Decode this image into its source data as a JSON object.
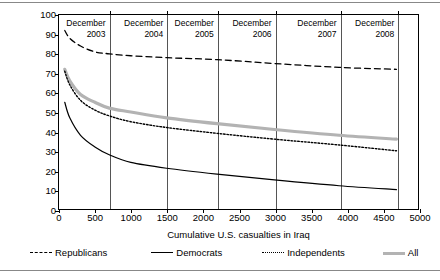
{
  "chart_data": {
    "type": "line",
    "title": "",
    "xlabel": "Cumulative U.S. casualties in Iraq",
    "ylabel": "Percentage supporting the war",
    "xlim": [
      0,
      5000
    ],
    "ylim": [
      0,
      100
    ],
    "xticks": [
      0,
      500,
      1000,
      1500,
      2000,
      2500,
      3000,
      3500,
      4000,
      4500,
      5000
    ],
    "yticks": [
      0,
      10,
      20,
      30,
      40,
      50,
      60,
      70,
      80,
      90,
      100
    ],
    "grid": false,
    "legend_position": "below",
    "annotations": [
      {
        "label_line1": "December",
        "label_line2": "2003",
        "x": 700
      },
      {
        "label_line1": "December",
        "label_line2": "2004",
        "x": 1500
      },
      {
        "label_line1": "December",
        "label_line2": "2005",
        "x": 2200
      },
      {
        "label_line1": "December",
        "label_line2": "2006",
        "x": 3000
      },
      {
        "label_line1": "December",
        "label_line2": "2007",
        "x": 3900
      },
      {
        "label_line1": "December",
        "label_line2": "2008",
        "x": 4700
      }
    ],
    "series": [
      {
        "name": "Republicans",
        "style": "dashed",
        "color": "#000000",
        "x": [
          80,
          150,
          300,
          500,
          700,
          1000,
          1500,
          2200,
          3000,
          3900,
          4700
        ],
        "values": [
          92,
          88,
          84,
          81,
          80,
          79,
          78,
          77,
          75,
          73,
          72
        ]
      },
      {
        "name": "Democrats",
        "style": "solid",
        "color": "#000000",
        "x": [
          80,
          150,
          300,
          500,
          700,
          1000,
          1500,
          2200,
          3000,
          3900,
          4700
        ],
        "values": [
          55,
          47,
          38,
          32,
          28,
          24,
          21,
          18,
          15,
          12,
          10
        ]
      },
      {
        "name": "Independents",
        "style": "dotted",
        "color": "#000000",
        "x": [
          80,
          150,
          300,
          500,
          700,
          1000,
          1500,
          2200,
          3000,
          3900,
          4700
        ],
        "values": [
          71,
          64,
          56,
          51,
          48,
          45,
          42,
          39,
          36,
          33,
          30
        ]
      },
      {
        "name": "All",
        "style": "thick",
        "color": "#b3b3b3",
        "x": [
          80,
          150,
          300,
          500,
          700,
          1000,
          1500,
          2200,
          3000,
          3900,
          4700
        ],
        "values": [
          72,
          66,
          59,
          55,
          52,
          50,
          47,
          44,
          41,
          38,
          36
        ]
      }
    ]
  },
  "legend": {
    "items": [
      {
        "label": "Republicans",
        "style": "dashed"
      },
      {
        "label": "Democrats",
        "style": "solid"
      },
      {
        "label": "Independents",
        "style": "dotted"
      },
      {
        "label": "All",
        "style": "thick"
      }
    ]
  }
}
